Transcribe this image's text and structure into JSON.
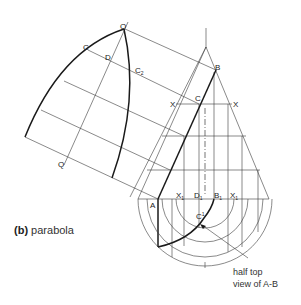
{
  "figure": {
    "caption_prefix": "(b)",
    "caption_text": "parabola",
    "note_line1": "half top",
    "note_line2": "view of A-B"
  },
  "labels": {
    "O_top": "O",
    "C_left": "C",
    "D": "D",
    "C2": "C",
    "C2_sub": "2",
    "Q": "Q",
    "B": "B",
    "C_front": "C",
    "X_left": "X",
    "X_right": "X",
    "A": "A",
    "X1_left": "X",
    "X1_left_sub": "1",
    "D1": "D",
    "D1_sub": "1",
    "B1": "B",
    "B1_sub": "1",
    "X1_right": "X",
    "X1_right_sub": "1",
    "C1": "C",
    "C1_sub": "1"
  },
  "colors": {
    "line": "#3a3a3a",
    "curve": "#1a1a1a",
    "text": "#333333"
  }
}
